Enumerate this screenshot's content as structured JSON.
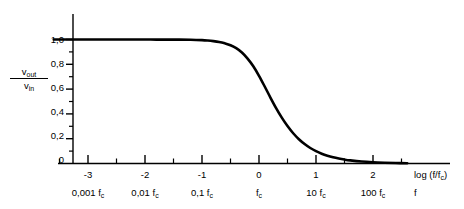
{
  "chart_data": {
    "type": "line",
    "title": "",
    "subtitle": "",
    "xlabel": "log (f/f_c)",
    "xlabel_secondary": "f",
    "ylabel_numerator": "v_out",
    "ylabel_denominator": "v_in",
    "xlim": [
      -3.6,
      2.6
    ],
    "ylim": [
      0,
      1.08
    ],
    "grid": false,
    "legend": false,
    "line_color": "#000000",
    "axis_color": "#000000",
    "background_color": "#ffffff",
    "x_major_ticks": [
      -3,
      -2,
      -1,
      0,
      1,
      2
    ],
    "x_major_tick_labels": [
      "-3",
      "-2",
      "-1",
      "0",
      "1",
      "2"
    ],
    "x_minor_ticks": [
      -3.5,
      -2.5,
      -1.5,
      -0.5,
      0.5,
      1.5,
      2.5
    ],
    "x_secondary_tick_labels": [
      "0,001 f_c",
      "0,01 f_c",
      "0,1 f_c",
      "f_c",
      "10 f_c",
      "100 f_c"
    ],
    "y_major_ticks": [
      0,
      0.2,
      0.4,
      0.6,
      0.8,
      1.0
    ],
    "y_major_tick_labels": [
      "0",
      "0,2",
      "0,4",
      "0,6",
      "0,8",
      "1,0"
    ],
    "y_minor_ticks": [
      0.1,
      0.3,
      0.5,
      0.7,
      0.9
    ],
    "series": [
      {
        "name": "low-pass magnitude response",
        "x": [
          -3.6,
          -3.4,
          -3.2,
          -3.0,
          -2.8,
          -2.6,
          -2.4,
          -2.2,
          -2.0,
          -1.8,
          -1.6,
          -1.4,
          -1.2,
          -1.0,
          -0.9,
          -0.8,
          -0.7,
          -0.6,
          -0.5,
          -0.4,
          -0.3,
          -0.2,
          -0.1,
          0.0,
          0.1,
          0.2,
          0.3,
          0.4,
          0.5,
          0.6,
          0.7,
          0.8,
          0.9,
          1.0,
          1.1,
          1.2,
          1.3,
          1.4,
          1.5,
          1.6,
          1.8,
          2.0,
          2.2,
          2.4,
          2.6
        ],
        "y": [
          1.0,
          1.0,
          1.0,
          1.0,
          1.0,
          1.0,
          1.0,
          1.0,
          1.0,
          0.999,
          0.999,
          0.999,
          0.998,
          0.995,
          0.992,
          0.987,
          0.98,
          0.969,
          0.954,
          0.93,
          0.895,
          0.846,
          0.784,
          0.707,
          0.621,
          0.532,
          0.447,
          0.37,
          0.302,
          0.244,
          0.196,
          0.157,
          0.125,
          0.0995,
          0.0791,
          0.0629,
          0.05,
          0.0398,
          0.0316,
          0.0251,
          0.0158,
          0.01,
          0.0063,
          0.004,
          0.0025
        ]
      }
    ],
    "annotations": []
  },
  "yaxis": {
    "label_numerator": "v",
    "label_numerator_sub": "out",
    "label_denominator": "v",
    "label_denominator_sub": "in",
    "ticks": [
      {
        "value": 1.0,
        "label": "1,0"
      },
      {
        "value": 0.8,
        "label": "0,8"
      },
      {
        "value": 0.6,
        "label": "0,6"
      },
      {
        "value": 0.4,
        "label": "0,4"
      },
      {
        "value": 0.2,
        "label": "0,2"
      },
      {
        "value": 0.0,
        "label": "0"
      }
    ]
  },
  "xaxis": {
    "title": "log (f/f",
    "title_sub": "c",
    "title_close": ")",
    "secondary_title": "f",
    "ticks": [
      {
        "value": -3,
        "label": "-3",
        "sub_prefix": "0,001 f",
        "sub_suffix": "c"
      },
      {
        "value": -2,
        "label": "-2",
        "sub_prefix": "0,01 f",
        "sub_suffix": "c"
      },
      {
        "value": -1,
        "label": "-1",
        "sub_prefix": "0,1 f",
        "sub_suffix": "c"
      },
      {
        "value": 0,
        "label": "0",
        "sub_prefix": "f",
        "sub_suffix": "c"
      },
      {
        "value": 1,
        "label": "1",
        "sub_prefix": "10 f",
        "sub_suffix": "c"
      },
      {
        "value": 2,
        "label": "2",
        "sub_prefix": "100 f",
        "sub_suffix": "c"
      }
    ]
  }
}
